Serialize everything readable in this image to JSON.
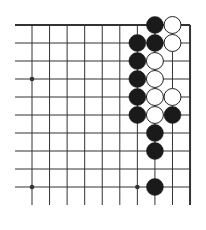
{
  "diagram": {
    "type": "go-board-fragment",
    "colors": {
      "background": "#ffffff",
      "line": "#333333",
      "black_stone": "#1a1a1a",
      "white_stone": "#ffffff",
      "white_stone_outline": "#222222"
    },
    "grid": {
      "columns": 10,
      "rows": 10,
      "x0": 32,
      "y0": 25,
      "dx": 17.56,
      "dy": 18,
      "left_stub_x": 15,
      "bottom_stub_y": 205,
      "top_edge": true,
      "right_edge": true
    },
    "star_points": [
      {
        "col": 0,
        "row": 3
      },
      {
        "col": 0,
        "row": 9
      },
      {
        "col": 6,
        "row": 9
      }
    ],
    "stones": [
      {
        "color": "black",
        "col": 7,
        "row": 0
      },
      {
        "color": "white",
        "col": 8,
        "row": 0
      },
      {
        "color": "black",
        "col": 6,
        "row": 1
      },
      {
        "color": "black",
        "col": 7,
        "row": 1
      },
      {
        "color": "white",
        "col": 8,
        "row": 1
      },
      {
        "color": "black",
        "col": 6,
        "row": 2
      },
      {
        "color": "white",
        "col": 7,
        "row": 2
      },
      {
        "color": "black",
        "col": 6,
        "row": 3
      },
      {
        "color": "white",
        "col": 7,
        "row": 3
      },
      {
        "color": "black",
        "col": 6,
        "row": 4
      },
      {
        "color": "white",
        "col": 7,
        "row": 4
      },
      {
        "color": "white",
        "col": 8,
        "row": 4
      },
      {
        "color": "black",
        "col": 6,
        "row": 5
      },
      {
        "color": "white",
        "col": 7,
        "row": 5
      },
      {
        "color": "black",
        "col": 8,
        "row": 5
      },
      {
        "color": "black",
        "col": 7,
        "row": 6
      },
      {
        "color": "black",
        "col": 7,
        "row": 7
      },
      {
        "color": "black",
        "col": 7,
        "row": 9
      }
    ]
  }
}
